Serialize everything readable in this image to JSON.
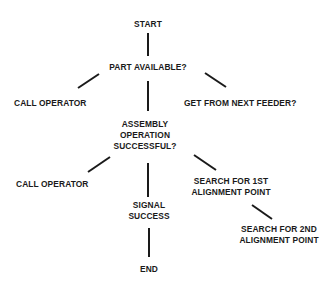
{
  "diagram": {
    "type": "flowchart-tree",
    "nodes": {
      "start": {
        "lines": [
          "START"
        ]
      },
      "part_available": {
        "lines": [
          "PART AVAILABLE?"
        ]
      },
      "call_operator_1": {
        "lines": [
          "CALL OPERATOR"
        ]
      },
      "get_from_next_feeder": {
        "lines": [
          "GET FROM NEXT FEEDER?"
        ]
      },
      "assembly_successful": {
        "lines": [
          "ASSEMBLY",
          "OPERATION",
          "SUCCESSFUL?"
        ]
      },
      "call_operator_2": {
        "lines": [
          "CALL OPERATOR"
        ]
      },
      "signal_success": {
        "lines": [
          "SIGNAL",
          "SUCCESS"
        ]
      },
      "search_1st": {
        "lines": [
          "SEARCH FOR 1ST",
          "ALIGNMENT POINT"
        ]
      },
      "search_2nd": {
        "lines": [
          "SEARCH FOR 2ND",
          "ALIGNMENT POINT"
        ]
      },
      "end": {
        "lines": [
          "END"
        ]
      }
    },
    "edges": [
      {
        "from": "start",
        "to": "part_available"
      },
      {
        "from": "part_available",
        "to": "call_operator_1"
      },
      {
        "from": "part_available",
        "to": "assembly_successful"
      },
      {
        "from": "part_available",
        "to": "get_from_next_feeder"
      },
      {
        "from": "assembly_successful",
        "to": "call_operator_2"
      },
      {
        "from": "assembly_successful",
        "to": "signal_success"
      },
      {
        "from": "assembly_successful",
        "to": "search_1st"
      },
      {
        "from": "search_1st",
        "to": "search_2nd"
      },
      {
        "from": "signal_success",
        "to": "end"
      }
    ],
    "line_color": "#1a1a1a",
    "text_color": "#1a1a1a"
  }
}
